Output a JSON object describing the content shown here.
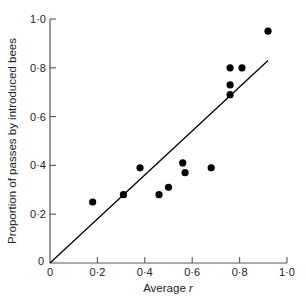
{
  "chart_data": {
    "type": "scatter",
    "title": "",
    "xlabel": "Average r",
    "xlabel_parts": {
      "text": "Average ",
      "var": "r"
    },
    "ylabel": "Proportion of passes by introduced bees",
    "xlim": [
      0,
      1.0
    ],
    "ylim": [
      0,
      1.0
    ],
    "xticks": [
      0,
      0.2,
      0.4,
      0.6,
      0.8,
      1.0
    ],
    "xtick_labels": [
      "0",
      "0·2",
      "0·4",
      "0·6",
      "0·8",
      "1·0"
    ],
    "yticks": [
      0,
      0.2,
      0.4,
      0.6,
      0.8,
      1.0
    ],
    "ytick_labels": [
      "0",
      "0·2",
      "0·4",
      "0·6",
      "0·8",
      "1·0"
    ],
    "grid": false,
    "legend": null,
    "series": [
      {
        "name": "observations",
        "marker": "filled-circle",
        "color": "#000000",
        "points": [
          {
            "x": 0.18,
            "y": 0.25
          },
          {
            "x": 0.31,
            "y": 0.28
          },
          {
            "x": 0.38,
            "y": 0.39
          },
          {
            "x": 0.46,
            "y": 0.28
          },
          {
            "x": 0.5,
            "y": 0.31
          },
          {
            "x": 0.56,
            "y": 0.41
          },
          {
            "x": 0.57,
            "y": 0.37
          },
          {
            "x": 0.68,
            "y": 0.39
          },
          {
            "x": 0.76,
            "y": 0.69
          },
          {
            "x": 0.76,
            "y": 0.73
          },
          {
            "x": 0.76,
            "y": 0.8
          },
          {
            "x": 0.81,
            "y": 0.8
          },
          {
            "x": 0.92,
            "y": 0.95
          }
        ]
      },
      {
        "name": "fit-line",
        "type": "line",
        "color": "#000000",
        "points": [
          {
            "x": 0,
            "y": 0
          },
          {
            "x": 0.92,
            "y": 0.83
          }
        ]
      }
    ]
  }
}
